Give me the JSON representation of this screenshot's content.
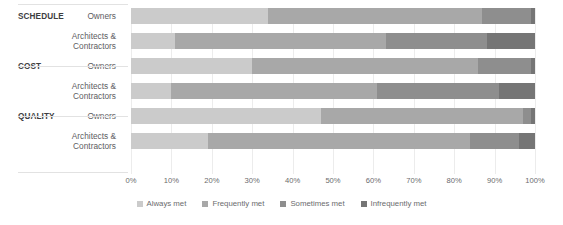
{
  "chart_data": {
    "type": "bar",
    "title": "",
    "subtitle": "",
    "orientation": "horizontal",
    "stacked": true,
    "stack_mode": "percent",
    "xlabel": "",
    "ylabel": "",
    "xlim": [
      0,
      100
    ],
    "grid": true,
    "legend_position": "bottom",
    "x_ticks": [
      "0%",
      "10%",
      "20%",
      "30%",
      "40%",
      "50%",
      "60%",
      "70%",
      "80%",
      "90%",
      "100%"
    ],
    "x_tick_values": [
      0,
      10,
      20,
      30,
      40,
      50,
      60,
      70,
      80,
      90,
      100
    ],
    "groups": [
      {
        "name": "SCHEDULE",
        "rows": [
          "Owners",
          "Architects & Contractors"
        ]
      },
      {
        "name": "COST",
        "rows": [
          "Owners",
          "Architects & Contractors"
        ]
      },
      {
        "name": "QUALITY",
        "rows": [
          "Owners",
          "Architects & Contractors"
        ]
      }
    ],
    "categories": [
      "SCHEDULE — Owners",
      "SCHEDULE — Architects & Contractors",
      "COST — Owners",
      "COST — Architects & Contractors",
      "QUALITY — Owners",
      "QUALITY — Architects & Contractors"
    ],
    "series": [
      {
        "name": "Always met",
        "color": "#cbcbcb",
        "values": [
          34,
          11,
          30,
          10,
          47,
          19
        ]
      },
      {
        "name": "Frequently met",
        "color": "#a8a8a8",
        "values": [
          53,
          52,
          56,
          51,
          50,
          65
        ]
      },
      {
        "name": "Sometimes met",
        "color": "#8e8e8e",
        "values": [
          12,
          25,
          13,
          30,
          2,
          12
        ]
      },
      {
        "name": "Infrequently met",
        "color": "#757575",
        "values": [
          1,
          12,
          1,
          9,
          1,
          4
        ]
      }
    ],
    "rows": [
      {
        "group": "SCHEDULE",
        "respondent": "Owners",
        "always_met": 34,
        "frequently_met": 53,
        "sometimes_met": 12,
        "infrequently_met": 1
      },
      {
        "group": "SCHEDULE",
        "respondent": "Architects & Contractors",
        "always_met": 11,
        "frequently_met": 52,
        "sometimes_met": 25,
        "infrequently_met": 12
      },
      {
        "group": "COST",
        "respondent": "Owners",
        "always_met": 30,
        "frequently_met": 56,
        "sometimes_met": 13,
        "infrequently_met": 1
      },
      {
        "group": "COST",
        "respondent": "Architects & Contractors",
        "always_met": 10,
        "frequently_met": 51,
        "sometimes_met": 30,
        "infrequently_met": 9
      },
      {
        "group": "QUALITY",
        "respondent": "Owners",
        "always_met": 47,
        "frequently_met": 50,
        "sometimes_met": 2,
        "infrequently_met": 1
      },
      {
        "group": "QUALITY",
        "respondent": "Architects & Contractors",
        "always_met": 19,
        "frequently_met": 65,
        "sometimes_met": 12,
        "infrequently_met": 4
      }
    ],
    "legend": [
      {
        "label": "Always met",
        "color": "#cbcbcb"
      },
      {
        "label": "Frequently met",
        "color": "#a8a8a8"
      },
      {
        "label": "Sometimes met",
        "color": "#8e8e8e"
      },
      {
        "label": "Infrequently met",
        "color": "#757575"
      }
    ]
  },
  "style": {
    "background": "#ffffff",
    "gridline_color": "#ececec",
    "rule_color": "#e2e2e2",
    "text_color": "#58585a"
  }
}
